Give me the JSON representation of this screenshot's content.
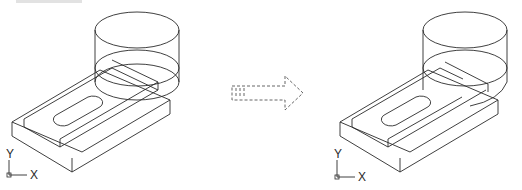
{
  "figure": {
    "caption_strip": "",
    "before": {
      "label": "Before union: base plate with slot and cylinder as separate solids",
      "ucs": {
        "x_label": "X",
        "y_label": "Y"
      }
    },
    "arrow": {
      "label": "transforms to"
    },
    "after": {
      "label": "After union: combined solid",
      "ucs": {
        "x_label": "X",
        "y_label": "Y"
      }
    }
  }
}
